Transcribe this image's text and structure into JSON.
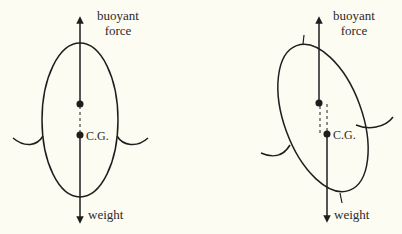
{
  "figures": [
    {
      "id": "upright",
      "labels": {
        "buoyant_line1": "buoyant",
        "buoyant_line2": "force",
        "cg": "C.G.",
        "weight": "weight"
      }
    },
    {
      "id": "tilted",
      "labels": {
        "buoyant_line1": "buoyant",
        "buoyant_line2": "force",
        "cg": "C.G.",
        "weight": "weight"
      }
    }
  ],
  "colors": {
    "background": "#fdfcf3",
    "ink": "#1e1e1e"
  }
}
